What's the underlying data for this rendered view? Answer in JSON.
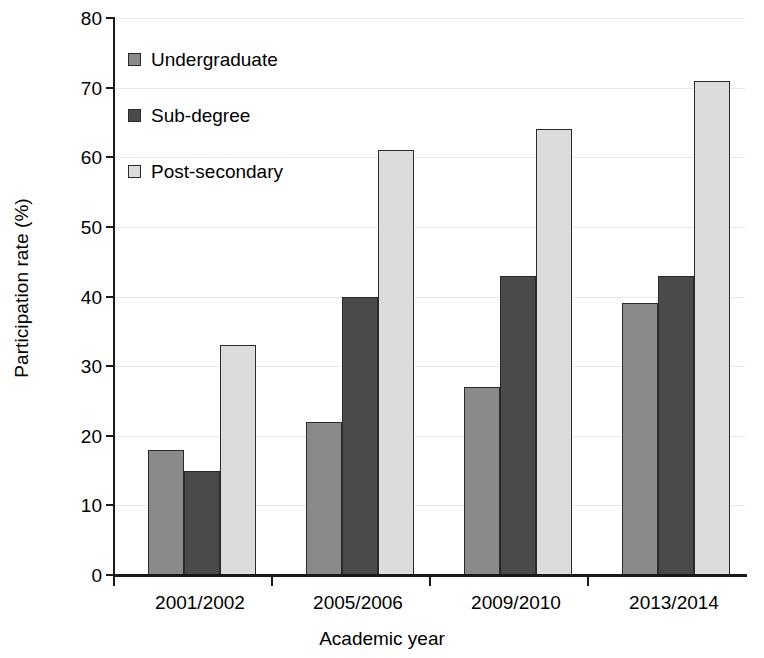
{
  "chart_data": {
    "type": "bar",
    "title": "",
    "xlabel": "Academic year",
    "ylabel": "Participation rate (%)",
    "categories": [
      "2001/2002",
      "2005/2006",
      "2009/2010",
      "2013/2014"
    ],
    "series": [
      {
        "name": "Undergraduate",
        "color": "#8a8a8a",
        "values": [
          18,
          22,
          27,
          39
        ]
      },
      {
        "name": "Sub-degree",
        "color": "#4a4a4a",
        "values": [
          15,
          40,
          43,
          43
        ]
      },
      {
        "name": "Post-secondary",
        "color": "#dcdcdc",
        "values": [
          33,
          61,
          64,
          71
        ]
      }
    ],
    "ylim": [
      0,
      80
    ],
    "yticks": [
      0,
      10,
      20,
      30,
      40,
      50,
      60,
      70,
      80
    ],
    "ytick_labels": [
      "0",
      "10",
      "20",
      "30",
      "40",
      "50",
      "60",
      "70",
      "80"
    ],
    "grid": true,
    "grid_axis": "y",
    "legend_position": "upper left",
    "axis_color": "#1a1a1a",
    "grid_color": "#e8e8e8",
    "bar_edge_color": "#2b2b2b",
    "background": "#ffffff"
  }
}
